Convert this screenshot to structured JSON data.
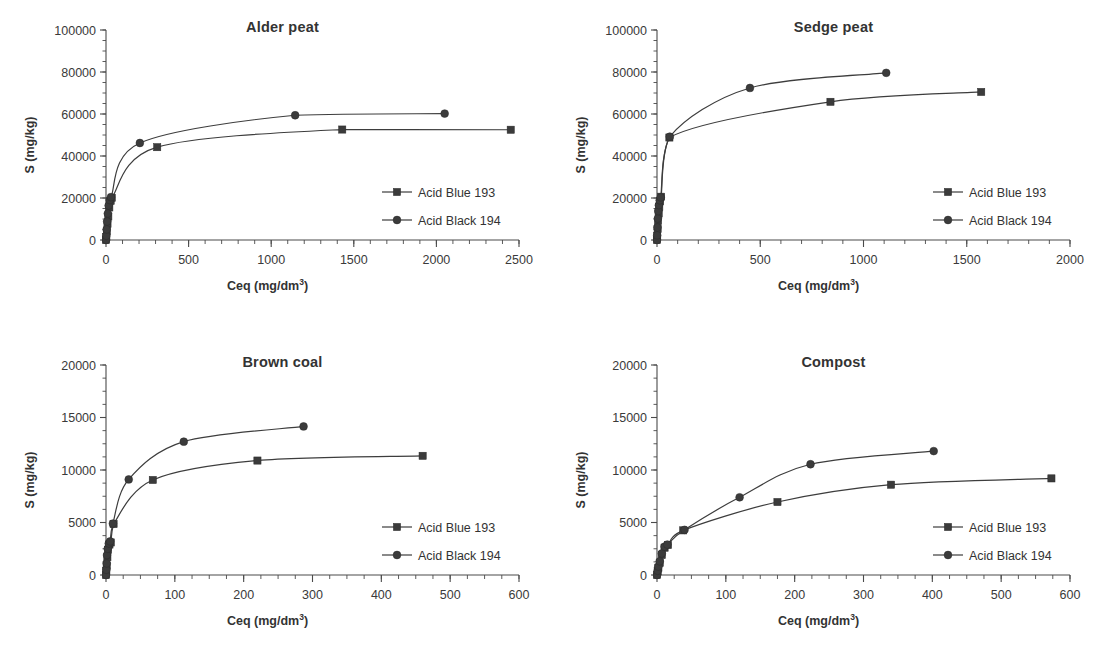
{
  "figure": {
    "background": "#ffffff",
    "series_color": "#3b3b3b",
    "axis_color": "#4a4a4a",
    "text_color": "#333333",
    "panel_count": 4
  },
  "common": {
    "xlabel_text": "Ceq (mg/dm",
    "xlabel_sup": "3",
    "xlabel_tail": ")",
    "ylabel": "S (mg/kg)",
    "legend_blue": "Acid Blue 193",
    "legend_black": "Acid Black 194",
    "marker_square": "square-marker",
    "marker_circle": "circle-marker"
  },
  "chart_data": [
    {
      "type": "scatter",
      "title": "Alder peat",
      "xlabel": "Ceq (mg/dm3)",
      "ylabel": "S (mg/kg)",
      "xlim": [
        0,
        2500
      ],
      "ylim": [
        0,
        100000
      ],
      "xticks": [
        0,
        500,
        1000,
        1500,
        2000,
        2500
      ],
      "yticks": [
        0,
        20000,
        40000,
        60000,
        80000,
        100000
      ],
      "xminor_step": 100,
      "yminor_step": 5000,
      "grid": false,
      "legend_position": "right-middle",
      "series": [
        {
          "name": "Acid Blue 193",
          "marker": "square",
          "x": [
            0,
            2,
            5,
            9,
            14,
            20,
            28,
            35,
            310,
            1430,
            2450
          ],
          "y": [
            0,
            1500,
            4200,
            7600,
            11200,
            15500,
            18600,
            20100,
            44200,
            52600,
            52500
          ]
        },
        {
          "name": "Acid Black 194",
          "marker": "circle",
          "x": [
            0,
            2,
            4,
            7,
            11,
            16,
            22,
            30,
            205,
            1145,
            2050
          ],
          "y": [
            0,
            2000,
            5000,
            8800,
            12600,
            16400,
            19000,
            20400,
            46200,
            59400,
            60200
          ]
        }
      ]
    },
    {
      "type": "scatter",
      "title": "Sedge peat",
      "xlabel": "Ceq (mg/dm3)",
      "ylabel": "S (mg/kg)",
      "xlim": [
        0,
        2000
      ],
      "ylim": [
        0,
        100000
      ],
      "xticks": [
        0,
        500,
        1000,
        1500,
        2000
      ],
      "yticks": [
        0,
        20000,
        40000,
        60000,
        80000,
        100000
      ],
      "xminor_step": 100,
      "yminor_step": 5000,
      "grid": false,
      "legend_position": "right-middle",
      "series": [
        {
          "name": "Acid Blue 193",
          "marker": "square",
          "x": [
            0,
            1,
            3,
            5,
            8,
            11,
            15,
            20,
            60,
            840,
            1570
          ],
          "y": [
            0,
            1800,
            5200,
            9000,
            12600,
            15800,
            18400,
            20600,
            48800,
            65800,
            70500
          ]
        },
        {
          "name": "Acid Black 194",
          "marker": "circle",
          "x": [
            0,
            1,
            2,
            4,
            6,
            9,
            13,
            18,
            62,
            450,
            1110
          ],
          "y": [
            0,
            2200,
            6000,
            10200,
            13800,
            16600,
            18900,
            20300,
            49200,
            72400,
            79600
          ]
        }
      ]
    },
    {
      "type": "scatter",
      "title": "Brown coal",
      "xlabel": "Ceq (mg/dm3)",
      "ylabel": "S (mg/kg)",
      "xlim": [
        0,
        600
      ],
      "ylim": [
        0,
        20000
      ],
      "xticks": [
        0,
        100,
        200,
        300,
        400,
        500,
        600
      ],
      "yticks": [
        0,
        5000,
        10000,
        15000,
        20000
      ],
      "xminor_step": 25,
      "yminor_step": 1250,
      "grid": false,
      "legend_position": "right-middle",
      "series": [
        {
          "name": "Acid Blue 193",
          "marker": "square",
          "x": [
            0,
            0.5,
            1,
            2,
            3,
            5,
            7,
            11,
            68,
            220,
            460
          ],
          "y": [
            0,
            400,
            900,
            1700,
            2400,
            2900,
            3100,
            4850,
            9050,
            10900,
            11350
          ]
        },
        {
          "name": "Acid Black 194",
          "marker": "circle",
          "x": [
            0,
            0.5,
            1,
            1.5,
            2.5,
            4,
            6,
            10,
            33,
            113,
            287
          ],
          "y": [
            0,
            500,
            1100,
            1900,
            2500,
            3000,
            3200,
            4900,
            9100,
            12700,
            14150
          ]
        }
      ]
    },
    {
      "type": "scatter",
      "title": "Compost",
      "xlabel": "Ceq (mg/dm3)",
      "ylabel": "S (mg/kg)",
      "xlim": [
        0,
        600
      ],
      "ylim": [
        0,
        20000
      ],
      "xticks": [
        0,
        100,
        200,
        300,
        400,
        500,
        600
      ],
      "yticks": [
        0,
        5000,
        10000,
        15000,
        20000
      ],
      "xminor_step": 25,
      "yminor_step": 1250,
      "grid": false,
      "legend_position": "right-middle",
      "series": [
        {
          "name": "Acid Blue 193",
          "marker": "square",
          "x": [
            0,
            1,
            2,
            4,
            7,
            11,
            16,
            38,
            175,
            340,
            573
          ],
          "y": [
            0,
            350,
            700,
            1150,
            1900,
            2600,
            2850,
            4250,
            6950,
            8600,
            9200
          ]
        },
        {
          "name": "Acid Black 194",
          "marker": "circle",
          "x": [
            0,
            1,
            2,
            4,
            7,
            11,
            15,
            40,
            120,
            223,
            402
          ],
          "y": [
            0,
            400,
            800,
            1300,
            2050,
            2700,
            2900,
            4300,
            7400,
            10550,
            11800
          ]
        }
      ]
    }
  ]
}
